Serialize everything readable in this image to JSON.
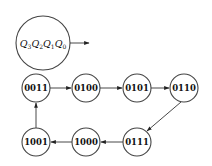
{
  "diagram": {
    "type": "state-transition",
    "legend": {
      "label_parts": [
        {
          "var": "Q",
          "sub": "3"
        },
        {
          "var": "Q",
          "sub": "2"
        },
        {
          "var": "Q",
          "sub": "1"
        },
        {
          "var": "Q",
          "sub": "0"
        }
      ]
    },
    "states": [
      "0011",
      "0100",
      "0101",
      "0110",
      "0111",
      "1000",
      "1001"
    ],
    "transitions": [
      {
        "from": "0011",
        "to": "0100"
      },
      {
        "from": "0100",
        "to": "0101"
      },
      {
        "from": "0101",
        "to": "0110"
      },
      {
        "from": "0110",
        "to": "0111"
      },
      {
        "from": "0111",
        "to": "1000"
      },
      {
        "from": "1000",
        "to": "1001"
      },
      {
        "from": "1001",
        "to": "0011"
      }
    ]
  }
}
